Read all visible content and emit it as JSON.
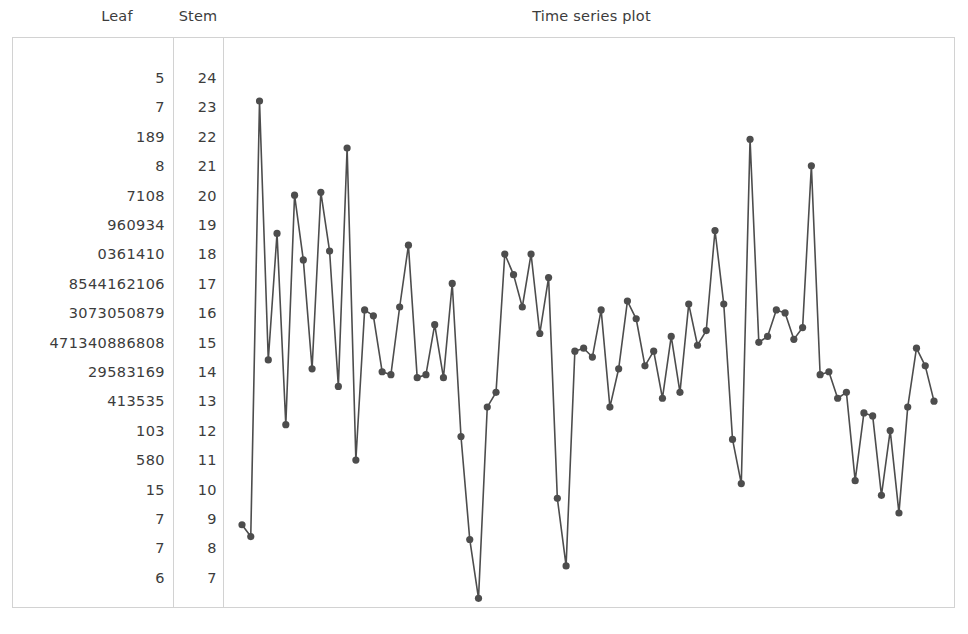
{
  "headers": {
    "leaf": "Leaf",
    "stem": "Stem",
    "plot_title": "Time series plot"
  },
  "colors": {
    "frame": "#d2d2d2",
    "text": "#3c3c3c",
    "series": "#4d4d4d",
    "background": "#ffffff"
  },
  "stem_leaf": {
    "rows": [
      {
        "stem": "24",
        "leaf": "5"
      },
      {
        "stem": "23",
        "leaf": "7"
      },
      {
        "stem": "22",
        "leaf": "189"
      },
      {
        "stem": "21",
        "leaf": "8"
      },
      {
        "stem": "20",
        "leaf": "7108"
      },
      {
        "stem": "19",
        "leaf": "960934"
      },
      {
        "stem": "18",
        "leaf": "0361410"
      },
      {
        "stem": "17",
        "leaf": "8544162106"
      },
      {
        "stem": "16",
        "leaf": "3073050879"
      },
      {
        "stem": "15",
        "leaf": "471340886808"
      },
      {
        "stem": "14",
        "leaf": "29583169"
      },
      {
        "stem": "13",
        "leaf": "413535"
      },
      {
        "stem": "12",
        "leaf": "103"
      },
      {
        "stem": "11",
        "leaf": "580"
      },
      {
        "stem": "10",
        "leaf": "15"
      },
      {
        "stem": "9",
        "leaf": "7"
      },
      {
        "stem": "8",
        "leaf": "7"
      },
      {
        "stem": "7",
        "leaf": "6"
      }
    ]
  },
  "chart_data": {
    "type": "line",
    "title": "Time series plot",
    "xlabel": "",
    "ylabel": "",
    "grid": false,
    "legend": false,
    "ylim": [
      7.0,
      24.5
    ],
    "xlim": [
      1,
      80
    ],
    "ytick_labels": [
      "24",
      "23",
      "22",
      "21",
      "20",
      "19",
      "18",
      "17",
      "16",
      "15",
      "14",
      "13",
      "12",
      "11",
      "10",
      "9",
      "8",
      "7"
    ],
    "ytick_values": [
      24,
      23,
      22,
      21,
      20,
      19,
      18,
      17,
      16,
      15,
      14,
      13,
      12,
      11,
      10,
      9,
      8,
      7
    ],
    "x": [
      1,
      2,
      3,
      4,
      5,
      6,
      7,
      8,
      9,
      10,
      11,
      12,
      13,
      14,
      15,
      16,
      17,
      18,
      19,
      20,
      21,
      22,
      23,
      24,
      25,
      26,
      27,
      28,
      29,
      30,
      31,
      32,
      33,
      34,
      35,
      36,
      37,
      38,
      39,
      40,
      41,
      42,
      43,
      44,
      45,
      46,
      47,
      48,
      49,
      50,
      51,
      52,
      53,
      54,
      55,
      56,
      57,
      58,
      59,
      60,
      61,
      62,
      63,
      64,
      65,
      66,
      67,
      68,
      69,
      70,
      71,
      72,
      73,
      74,
      75,
      76,
      77,
      78,
      79,
      80
    ],
    "values": [
      10.1,
      9.7,
      24.5,
      15.7,
      20.0,
      13.5,
      21.3,
      19.1,
      15.4,
      21.4,
      19.4,
      14.8,
      22.9,
      12.3,
      17.4,
      17.2,
      15.3,
      15.2,
      17.5,
      19.6,
      15.1,
      15.2,
      16.9,
      15.1,
      18.3,
      13.1,
      9.6,
      7.6,
      14.1,
      14.6,
      19.3,
      18.6,
      17.5,
      19.3,
      16.6,
      18.5,
      11.0,
      8.7,
      16.0,
      16.1,
      15.8,
      17.4,
      14.1,
      15.4,
      17.7,
      17.1,
      15.5,
      16.0,
      14.4,
      16.5,
      14.6,
      17.6,
      16.2,
      16.7,
      20.1,
      17.6,
      13.0,
      11.5,
      23.2,
      16.3,
      16.5,
      17.4,
      17.3,
      16.4,
      16.8,
      22.3,
      15.2,
      15.3,
      14.4,
      14.6,
      11.6,
      13.9,
      13.8,
      11.1,
      13.3,
      10.5,
      14.1,
      16.1,
      15.5,
      14.3
    ],
    "marker": "circle",
    "line_color": "#4d4d4d",
    "marker_color": "#4d4d4d"
  },
  "plot_geometry": {
    "x_left": 18,
    "x_right": 710,
    "y_top_value": 24.5,
    "y_top_px": 63,
    "y_bottom_value": 7.0,
    "y_bottom_px": 578
  }
}
